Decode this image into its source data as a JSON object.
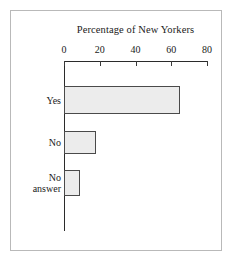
{
  "chart_data": {
    "type": "bar",
    "orientation": "horizontal",
    "title": "Percentage of New Yorkers",
    "xlabel": "",
    "ylabel": "",
    "categories": [
      "Yes",
      "No",
      "No answer"
    ],
    "values": [
      65,
      18,
      9
    ],
    "xlim": [
      0,
      80
    ],
    "xticks": [
      0,
      20,
      40,
      60,
      80
    ],
    "xtick_labels": [
      "0",
      "20",
      "40",
      "60",
      "80"
    ],
    "grid": false,
    "legend": false,
    "axis_position": "top",
    "bar_fill_color": "#ececec",
    "bar_edge_color": "#4a4a4a",
    "axis_color": "#2b2b2b",
    "frame_color": "#b9b9b9",
    "background_color": "#ffffff",
    "bars": [
      {
        "label": "Yes",
        "value": 65,
        "top": 86,
        "height": 28
      },
      {
        "label": "No",
        "value": 18,
        "top": 131,
        "height": 23
      },
      {
        "label": "No\nanswer",
        "value": 9,
        "top": 170,
        "height": 26
      }
    ]
  }
}
